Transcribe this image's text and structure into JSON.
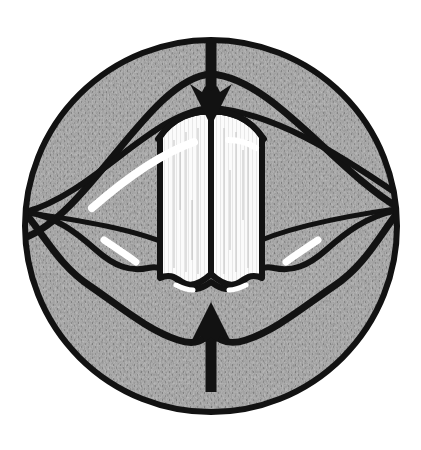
{
  "figure": {
    "kind": "anatomical-line-drawing",
    "caption": "",
    "background_color": "#ffffff",
    "canvas": {
      "width": 421,
      "height": 450
    }
  },
  "circle": {
    "name": "field-of-view-circle",
    "center_x": 211,
    "center_y": 226,
    "radius": 189,
    "outline_color": "#121212",
    "outline_width": 6,
    "fill_color": "#8b8b8b"
  },
  "texture": {
    "name": "mottled-halftone-tissue",
    "base_color": "#8b8b8b",
    "dark_speckle_color": "#4f4f4f",
    "light_speckle_color": "#b8b8b8",
    "striation_color": "#6e6e6e",
    "striation_spacing_px": 3
  },
  "strokes": {
    "ink_color": "#121212",
    "main_width": 6,
    "thin_width": 4,
    "highlight_color": "#ffffff",
    "highlight_width": 5
  },
  "anatomy": {
    "upper_arch": {
      "name": "upper-arch-curve",
      "label": "superior arch",
      "path": "M 24 238 C 90 214 150 78 211 74 C 272 78 334 170 399 208"
    },
    "upper_inner_arch": {
      "name": "upper-inner-arch-curve",
      "label": "superior inner arch",
      "path": "M 26 212 C 96 192 152 112 211 108 C 272 112 336 152 400 196"
    },
    "vestibule_fold_left": {
      "name": "left-vestibular-fold",
      "path": "M 24 212 C 80 222 140 232 178 250"
    },
    "vestibule_fold_right": {
      "name": "right-vestibular-fold",
      "path": "M 399 208 C 344 218 284 230 246 248"
    },
    "lower_wave_outer": {
      "name": "lower-outer-wavy-curve",
      "label": "inferior outer contour",
      "path": "M 26 214 C 46 238 60 266 90 286 C 122 308 148 330 178 340 C 196 346 204 340 211 332 C 218 340 228 346 246 340 C 276 330 302 308 334 286 C 364 266 378 238 398 212"
    },
    "lower_wave_inner": {
      "name": "lower-inner-wavy-curve",
      "label": "inferior inner contour",
      "path": "M 26 212 C 56 216 78 234 96 250 C 114 266 130 272 148 268 C 164 264 172 276 182 284 C 192 292 200 290 211 282 C 222 290 230 292 240 284 C 250 276 258 264 274 268 C 292 272 308 266 326 250 C 344 234 366 216 398 210"
    }
  },
  "vocal_folds": {
    "name": "vocal-folds-group",
    "label": "vocal folds (white)",
    "fill_color": "#fbfbfb",
    "outline_color": "#121212",
    "midline_color": "#121212",
    "left_fold": {
      "name": "left-vocal-fold",
      "path": "M 163 135 C 170 124 192 118 209 124 L 209 272 C 200 282 190 286 182 280 C 174 274 168 276 163 280 Z"
    },
    "right_fold": {
      "name": "right-vocal-fold",
      "path": "M 259 135 C 252 124 230 118 213 124 L 213 272 C 222 282 232 286 240 280 C 248 274 254 276 259 280 Z"
    },
    "midline": {
      "name": "glottic-midline",
      "path": "M 211 122 L 211 276"
    },
    "top_arch": {
      "name": "vocal-fold-top-arch",
      "path": "M 160 137 C 172 118 194 110 211 112 C 228 110 250 118 262 137"
    },
    "striation_color": "#c9c9c9"
  },
  "arrows": [
    {
      "name": "superior-compression-arrow",
      "direction": "down",
      "label": "downward force",
      "color": "#121212",
      "shaft_x": 211,
      "shaft_top_y": 33,
      "shaft_bottom_y": 92,
      "shaft_width": 11,
      "head_half_width": 20,
      "head_tip_y": 124,
      "head_base_y": 86
    },
    {
      "name": "inferior-compression-arrow",
      "direction": "up",
      "label": "upward force",
      "color": "#121212",
      "shaft_x": 211,
      "shaft_top_y": 332,
      "shaft_bottom_y": 392,
      "shaft_width": 11,
      "head_half_width": 20,
      "head_tip_y": 304,
      "head_base_y": 340
    }
  ],
  "highlights": [
    {
      "name": "upper-arch-highlight",
      "path": "M 92 208 C 124 180 160 154 194 142",
      "width": 8
    },
    {
      "name": "upper-arch-highlight-right",
      "path": "M 228 140 C 240 140 250 144 256 148",
      "width": 6
    },
    {
      "name": "left-lower-highlight",
      "path": "M 104 240 C 116 248 128 256 136 262",
      "width": 7
    },
    {
      "name": "right-lower-highlight",
      "path": "M 318 240 C 306 248 294 256 286 262",
      "width": 7
    },
    {
      "name": "left-notch-highlight",
      "path": "M 176 285 C 182 288 188 290 193 290",
      "width": 5
    },
    {
      "name": "right-notch-highlight",
      "path": "M 246 285 C 240 288 234 290 229 290",
      "width": 5
    }
  ],
  "accessibility": {
    "alt_text": "Circular laryngoscopic illustration showing the vocal folds as two white vertical bands at the center, surrounded by gray textured tissue, with a large black arrow pointing down from above and a large black arrow pointing up from below."
  }
}
